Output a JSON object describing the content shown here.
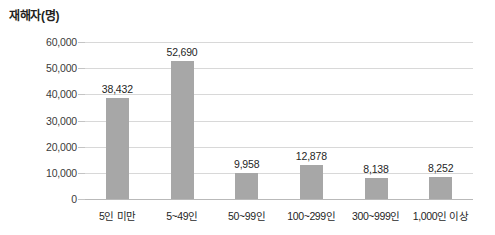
{
  "chart_data": {
    "type": "bar",
    "title": "재해자(명)",
    "xlabel": "",
    "ylabel": "재해자(명)",
    "categories": [
      "5인 미만",
      "5~49인",
      "50~99인",
      "100~299인",
      "300~999인",
      "1,000인 이상"
    ],
    "values": [
      38432,
      52690,
      9958,
      12878,
      8138,
      8252
    ],
    "value_labels": [
      "38,432",
      "52,690",
      "9,958",
      "12,878",
      "8,138",
      "8,252"
    ],
    "ylim": [
      0,
      60000
    ],
    "ytick_values": [
      60000,
      50000,
      40000,
      30000,
      20000,
      10000,
      0
    ],
    "ytick_labels": [
      "60,000",
      "50,000",
      "40,000",
      "30,000",
      "20,000",
      "10,000",
      "0"
    ],
    "grid": true,
    "legend": "none",
    "bar_color": "#a7a7a7",
    "grid_color": "#d8d8d8",
    "text_color": "#231f20",
    "background": "#ffffff"
  }
}
